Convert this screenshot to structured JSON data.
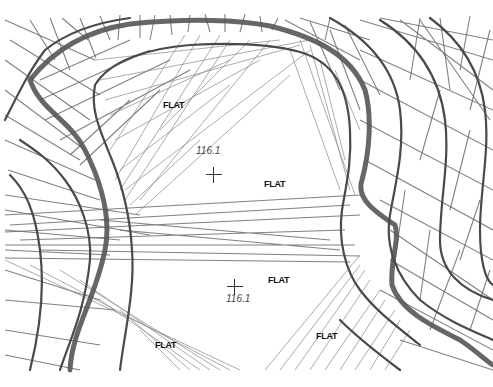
{
  "figure": {
    "type": "TIN contour map (triangulated irregular network)",
    "flat_labels": [
      {
        "text": "FLAT",
        "x": 163,
        "y": 100
      },
      {
        "text": "FLAT",
        "x": 264,
        "y": 179
      },
      {
        "text": "FLAT",
        "x": 268,
        "y": 275
      },
      {
        "text": "FLAT",
        "x": 155,
        "y": 340
      },
      {
        "text": "FLAT",
        "x": 316,
        "y": 331
      }
    ],
    "spot_elevations": [
      {
        "value": "116.1",
        "label_x": 196,
        "label_y": 147,
        "cross_x": 206,
        "cross_y": 167
      },
      {
        "value": "116.1",
        "label_x": 226,
        "label_y": 293,
        "cross_x": 227,
        "cross_y": 279
      }
    ],
    "caption": ""
  },
  "colors": {
    "background": "#ffffff",
    "contour": "#4a4a4a",
    "triangulation": "#6a6a6a",
    "label": "#111111"
  }
}
